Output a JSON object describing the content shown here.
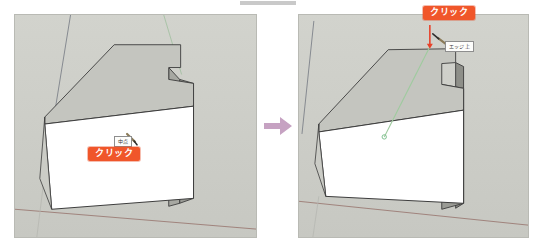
{
  "figure": {
    "type": "before-after-step",
    "panel_count": 2,
    "transition_icon": "right-arrow-icon",
    "transition_color": "#c6a2c2"
  },
  "panels": {
    "left": {
      "name": "before-step",
      "background_color": "#cdcec8",
      "badge": {
        "label": "クリック",
        "color": "#f0562a",
        "text_color": "#ffffff"
      },
      "tooltip": {
        "label": "中点",
        "border_color": "#8e8e8e",
        "background_color": "#fdfdfb"
      },
      "cursor_icon": "pencil-cursor-icon",
      "shape": {
        "top_face_color": "#c4c5bf",
        "front_face_color": "#ffffff",
        "side_face_color": "#9a9b95",
        "edge_color": "#3c3c3c"
      },
      "axes": {
        "green_axis_color": "#8fb98f",
        "red_axis_color": "#9b7b74",
        "blue_axis_color": "#6f7480"
      }
    },
    "right": {
      "name": "after-step",
      "background_color": "#cdcec8",
      "badge": {
        "label": "クリック",
        "color": "#f0562a",
        "text_color": "#ffffff"
      },
      "tooltip": {
        "label": "エッジ上",
        "border_color": "#8e8e8e",
        "background_color": "#fdfdfb"
      },
      "cursor_icon": "pencil-cursor-icon",
      "pointer_icon": "red-down-arrow-icon",
      "pointer_color": "#e8422a",
      "guide_line": {
        "name": "green-inference-guide",
        "color": "#9ecb9e"
      },
      "shape": {
        "top_face_color": "#c4c5bf",
        "front_face_color": "#ffffff",
        "side_face_color": "#8e8f89",
        "edge_color": "#3c3c3c"
      },
      "axes": {
        "green_axis_color": "#8fb98f",
        "red_axis_color": "#9b7b74",
        "blue_axis_color": "#6f7480"
      }
    }
  }
}
